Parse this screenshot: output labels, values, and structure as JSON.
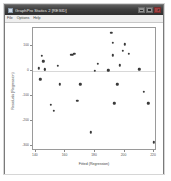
{
  "window": {
    "title": "GraphPro Statics 2 [RESID]",
    "icon": "app-icon",
    "controls": [
      {
        "name": "minimize-button",
        "glyph": "_"
      },
      {
        "name": "maximize-button",
        "glyph": "□"
      },
      {
        "name": "close-button",
        "glyph": "×"
      }
    ]
  },
  "menubar": {
    "items": [
      {
        "label": "File"
      },
      {
        "label": "Options"
      },
      {
        "label": "Help"
      }
    ]
  },
  "chart_data": {
    "type": "scatter",
    "title": "",
    "xlabel": "Fitted (Regression)",
    "ylabel": "Residuals (Regression)",
    "xlim": [
      138,
      222
    ],
    "ylim": [
      -320,
      170
    ],
    "xticks": [
      140,
      160,
      180,
      200,
      220
    ],
    "yticks": [
      -300,
      -200,
      -100,
      0,
      100
    ],
    "grid": false,
    "legend": false,
    "reference_line_y": 0,
    "marker": "filled-circle",
    "marker_color": "#3a3a3a",
    "points": [
      {
        "x": 142,
        "y": 10
      },
      {
        "x": 143,
        "y": -35
      },
      {
        "x": 144,
        "y": 60
      },
      {
        "x": 145,
        "y": 38
      },
      {
        "x": 146,
        "y": 3
      },
      {
        "x": 146,
        "y": 5
      },
      {
        "x": 150,
        "y": -135
      },
      {
        "x": 152,
        "y": -160
      },
      {
        "x": 155,
        "y": 20
      },
      {
        "x": 156,
        "y": -55
      },
      {
        "x": 164,
        "y": 63
      },
      {
        "x": 165,
        "y": 64
      },
      {
        "x": 166,
        "y": 68
      },
      {
        "x": 168,
        "y": -120
      },
      {
        "x": 170,
        "y": -55
      },
      {
        "x": 177,
        "y": -245
      },
      {
        "x": 180,
        "y": 0
      },
      {
        "x": 182,
        "y": 28
      },
      {
        "x": 189,
        "y": 2
      },
      {
        "x": 191,
        "y": 150
      },
      {
        "x": 192,
        "y": 112
      },
      {
        "x": 192,
        "y": 62
      },
      {
        "x": 193,
        "y": -130
      },
      {
        "x": 195,
        "y": -55
      },
      {
        "x": 197,
        "y": 22
      },
      {
        "x": 199,
        "y": 78
      },
      {
        "x": 200,
        "y": 105
      },
      {
        "x": 203,
        "y": 66
      },
      {
        "x": 210,
        "y": 5
      },
      {
        "x": 213,
        "y": -85
      },
      {
        "x": 216,
        "y": -130
      },
      {
        "x": 220,
        "y": -285
      }
    ]
  }
}
